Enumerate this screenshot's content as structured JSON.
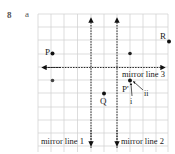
{
  "question": {
    "number": "8",
    "part": "a"
  },
  "diagram": {
    "grid": {
      "x0": 38,
      "y0": 14,
      "cell": 13.1,
      "cols": 10,
      "rows": 10,
      "color": "#cfcfcf"
    },
    "mirror_lines": [
      {
        "id": "mirror-line-1",
        "label": "mirror line 1",
        "orientation": "vertical"
      },
      {
        "id": "mirror-line-2",
        "label": "mirror line 2",
        "orientation": "vertical"
      },
      {
        "id": "mirror-line-3",
        "label": "mirror line 3",
        "orientation": "horizontal"
      }
    ],
    "points": [
      {
        "label": "P",
        "note": "original point"
      },
      {
        "label": "R",
        "note": "point"
      },
      {
        "label": "Q",
        "note": "point"
      },
      {
        "label": "P'",
        "note": "image point"
      }
    ],
    "annotations": {
      "arrow_i": "i",
      "arrow_ii": "ii"
    }
  }
}
